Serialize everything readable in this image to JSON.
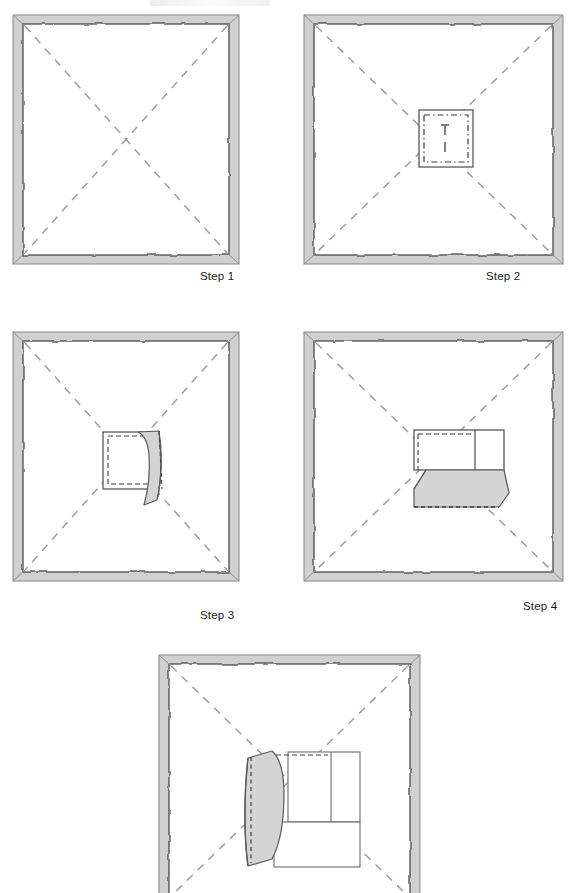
{
  "document": {
    "type": "instructional-diagram",
    "subject": "napkin-folding-steps",
    "background_color": "#ffffff",
    "width": 572,
    "height": 893
  },
  "style": {
    "hem_band_fill": "#d0d0d0",
    "hem_band_stroke": "#9a9a9a",
    "cloth_fill": "#ffffff",
    "cloth_stroke": "#4a4a4a",
    "fold_line_color": "#9e9e9e",
    "flap_fill": "#d4d4d4",
    "flap_stroke": "#5a5a5a",
    "detail_stroke": "#555555",
    "label_color": "#1a1a1a"
  },
  "panels": [
    {
      "id": "step-1",
      "label": "Step 1",
      "label_x": 200,
      "label_y": 270,
      "frame": {
        "x": 12,
        "y": 14,
        "w": 228,
        "h": 251
      },
      "description": "Flat square napkin with wavy hemmed border and two dashed diagonal fold lines forming an X",
      "diagonals": [
        "top-left-to-bottom-right",
        "top-right-to-bottom-left"
      ],
      "center_square": false,
      "flap": "none"
    },
    {
      "id": "step-2",
      "label": "Step 2",
      "label_x": 486,
      "label_y": 270,
      "frame": {
        "x": 303,
        "y": 14,
        "w": 258,
        "h": 251
      },
      "description": "Napkin with a small solid-outlined square marked at the centre; inside it a dash-dot square and a short vertical broken tick",
      "diagonals": [
        "top-left-to-bottom-right",
        "top-right-to-bottom-left"
      ],
      "center_square": true,
      "center_square_rect": {
        "x": 419,
        "y": 110,
        "w": 54,
        "h": 57
      },
      "flap": "none"
    },
    {
      "id": "step-3",
      "label": "Step 3",
      "label_x": 200,
      "label_y": 609,
      "frame": {
        "x": 12,
        "y": 331,
        "w": 228,
        "h": 251
      },
      "description": "Centre square with dashed inner outline; right half lifted as a curved shaded flap standing vertically",
      "diagonals": [
        "top-left-to-bottom-right",
        "top-right-to-bottom-left"
      ],
      "center_square": true,
      "center_square_rect": {
        "x": 103,
        "y": 432,
        "w": 54,
        "h": 57
      },
      "flap": "vertical-right-lifted"
    },
    {
      "id": "step-4",
      "label": "Step 4",
      "label_x": 523,
      "label_y": 600,
      "frame": {
        "x": 303,
        "y": 331,
        "w": 258,
        "h": 251
      },
      "description": "Centre panel divided by a vertical line on the right; lower half folded forward as a shaded parallelogram flap",
      "diagonals": [
        "top-left-to-bottom-right",
        "top-right-to-bottom-left"
      ],
      "center_square": true,
      "center_square_rect": {
        "x": 414,
        "y": 430,
        "w": 90,
        "h": 40
      },
      "flap": "horizontal-bottom-folded"
    },
    {
      "id": "step-5",
      "label": "",
      "label_x": 0,
      "label_y": 0,
      "frame": {
        "x": 158,
        "y": 654,
        "w": 264,
        "h": 239
      },
      "description": "Final arrangement: pockets formed at centre with a shaded curved flap opened to the left; bottom of panel runs off the image edge",
      "diagonals": [
        "top-left-to-bottom-right",
        "top-right-to-bottom-left"
      ],
      "center_square": true,
      "center_square_rect": {
        "x": 272,
        "y": 752,
        "w": 88,
        "h": 95
      },
      "flap": "vertical-left-opened",
      "cropped_at_bottom": true
    }
  ],
  "labels": {
    "step1": "Step 1",
    "step2": "Step 2",
    "step3": "Step 3",
    "step4": "Step 4"
  }
}
